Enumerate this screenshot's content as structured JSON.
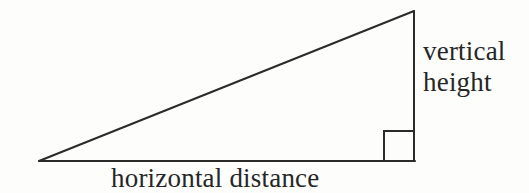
{
  "figure": {
    "kind": "right-triangle-diagram",
    "width": 529,
    "height": 193,
    "background_color": "#fdfdfc",
    "stroke_color": "#2b2b2b",
    "stroke_width": 2,
    "text_color": "#262626"
  },
  "geometry": {
    "left_apex": {
      "x": 39,
      "y": 161
    },
    "top_right_vertex": {
      "x": 414,
      "y": 11
    },
    "bottom_right_vertex": {
      "x": 414,
      "y": 161
    },
    "right_angle_marker": {
      "x": 384,
      "y": 131,
      "size": 30,
      "at_vertex": "bottom-right"
    }
  },
  "labels": {
    "vertical": {
      "line1": "vertical",
      "line2": "height",
      "full_text": "vertical height",
      "position": "right-of-vertical-leg"
    },
    "horizontal": {
      "text": "horizontal distance",
      "position": "below-baseline"
    }
  }
}
